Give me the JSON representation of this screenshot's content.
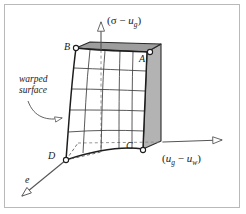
{
  "figure": {
    "kind": "3d-state-surface-diagram",
    "background": "#ffffff",
    "border_color": "#b9b9b9",
    "line_color": "#1a1a1a",
    "shade_face_color": "#b0b0b0",
    "shade_top_color": "#9a9a9a",
    "mesh_color": "#3a3a3a",
    "dash_color": "#7a7a7a"
  },
  "axes": {
    "vertical": {
      "name": "vertical-axis",
      "label_prefix": "(σ − ",
      "label_var": "u",
      "label_sub": "g",
      "label_suffix": ")",
      "label_text": "(σ − u_g)",
      "arrow": "hollow-triangle-up"
    },
    "horizontal": {
      "name": "horizontal-axis",
      "label_prefix": "(",
      "label_var1": "u",
      "label_sub1": "g",
      "label_mid": " − ",
      "label_var2": "u",
      "label_sub2": "w",
      "label_suffix": ")",
      "label_text": "(u_g − u_w)",
      "arrow": "hollow-triangle-right"
    },
    "depth": {
      "name": "depth-axis",
      "label_text": "e",
      "arrow": "hollow-triangle-down-left"
    }
  },
  "corners": [
    {
      "id": "A",
      "label": "A",
      "marker": "open-circle"
    },
    {
      "id": "B",
      "label": "B",
      "marker": "open-circle"
    },
    {
      "id": "C",
      "label": "C",
      "marker": "open-circle"
    },
    {
      "id": "D",
      "label": "D",
      "marker": "open-circle"
    }
  ],
  "annotations": [
    {
      "name": "warped-surface-annotation",
      "line1": "warped",
      "line2": "surface",
      "text": "warped surface",
      "leader": "curved-line-with-hollow-arrowhead"
    }
  ]
}
